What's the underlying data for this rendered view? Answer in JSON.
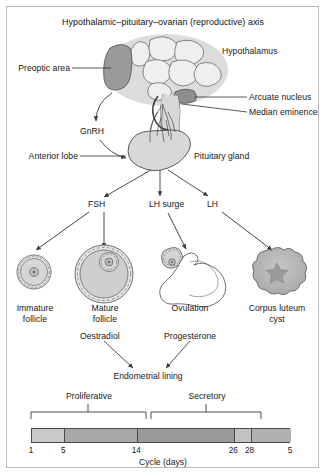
{
  "figure": {
    "title": "Hypothalamic–pituitary–ovarian (reproductive) axis"
  },
  "brain": {
    "hypothalamus_label": "Hypothalamus",
    "preoptic_area_label": "Preoptic area",
    "arcuate_nucleus_label": "Arcuate nucleus",
    "median_eminence_label": "Median eminence",
    "pituitary_gland_label": "Pituitary gland",
    "anterior_lobe_label": "Anterior lobe",
    "gnrh_label": "GnRH"
  },
  "hormones": {
    "fsh_label": "FSH",
    "lh_surge_label": "LH surge",
    "lh_label": "LH",
    "oestradiol_label": "Oestradiol",
    "progesterone_label": "Progesterone"
  },
  "ovary_stages": [
    {
      "line1": "Immature",
      "line2": "follicle"
    },
    {
      "line1": "Mature",
      "line2": "follicle"
    },
    {
      "line1": "Ovulation",
      "line2": ""
    },
    {
      "line1": "Corpus luteum",
      "line2": "cyst"
    }
  ],
  "endometrium": {
    "target_label": "Endometrial lining",
    "phase_proliferative": "Proliferative",
    "phase_secretory": "Secretory",
    "caption": "Cycle (days)",
    "ticks": [
      "1",
      "5",
      "14",
      "26",
      "28",
      "5"
    ]
  },
  "chart_data": {
    "type": "bar",
    "title": "Cycle (days)",
    "xlabel": "Cycle (days)",
    "ylabel": "",
    "categories": [
      "1",
      "5",
      "14",
      "26",
      "28",
      "5"
    ],
    "segments": [
      {
        "from_day": 1,
        "to_day": 5,
        "shade": "#c9c9c9",
        "phase": "Proliferative"
      },
      {
        "from_day": 5,
        "to_day": 14,
        "shade": "#a8a8a8",
        "phase": "Proliferative"
      },
      {
        "from_day": 14,
        "to_day": 26,
        "shade": "#9a9a9a",
        "phase": "Secretory"
      },
      {
        "from_day": 26,
        "to_day": 28,
        "shade": "#c2c2c2",
        "phase": "Secretory"
      },
      {
        "from_day": 28,
        "to_day": 33,
        "shade": "#b0b0b0",
        "phase": ""
      }
    ],
    "brackets": [
      {
        "label": "Proliferative",
        "from_day": 1,
        "to_day": 14
      },
      {
        "label": "Secretory",
        "from_day": 14,
        "to_day": 28
      }
    ],
    "grid": false,
    "legend": "none"
  },
  "colors": {
    "hypothalamus_bg": "#dcdcdc",
    "preoptic_fill": "#969696",
    "nucleus_fill": "#ececec",
    "pituitary_fill": "#d6d6d6",
    "corpus_luteum_fill": "#b4b4b4",
    "arrow_stroke": "#3a3a3a",
    "outline": "#4a4a4a"
  }
}
